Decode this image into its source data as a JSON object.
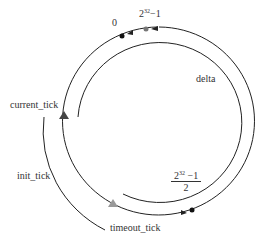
{
  "diagram": {
    "labels": {
      "zero": "0",
      "max_base": "2",
      "max_exp": "32",
      "max_tail": "−1",
      "delta": "delta",
      "current_tick": "current_tick",
      "init_tick": "init_tick",
      "timeout_tick": "timeout_tick",
      "half_num_base": "2",
      "half_num_exp": "32",
      "half_num_tail": " −1",
      "half_den": "2"
    },
    "colors": {
      "line": "#222222",
      "dot_black": "#111111",
      "dot_gray": "#777777",
      "marker_dark": "#444444",
      "marker_light": "#999999"
    }
  }
}
